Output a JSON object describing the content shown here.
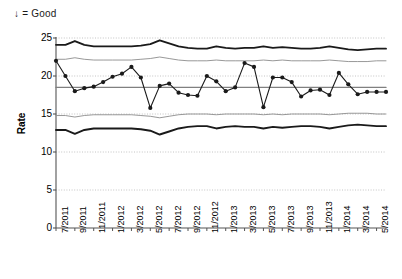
{
  "annotation": {
    "text": "↓ = Good"
  },
  "axes": {
    "y_title": "Rate",
    "y_ticks": [
      0,
      5,
      10,
      15,
      20,
      25
    ],
    "x_ticks": [
      "7/2011",
      "9/2011",
      "11/2011",
      "1/2012",
      "3/2012",
      "5/2012",
      "7/2012",
      "9/2012",
      "11/2012",
      "1/2013",
      "3/2013",
      "5/2013",
      "7/2013",
      "9/2013",
      "11/2013",
      "1/2014",
      "3/2014",
      "5/2014"
    ]
  },
  "colors": {
    "series": "#1a1a1a",
    "control_limit": "#1a1a1a",
    "sigma_line": "#8c8c8c",
    "center_line": "#808080",
    "grid": "#b5b5b5",
    "axis": "#555555"
  },
  "chart_data": {
    "type": "line",
    "title": "",
    "subtitle": "",
    "xlabel": "",
    "ylabel": "Rate",
    "ylim": [
      0,
      25
    ],
    "grid": true,
    "grid_style": "dotted-horizontal",
    "legend": "none",
    "annotations": [
      "↓ = Good"
    ],
    "x": [
      "7/2011",
      "8/2011",
      "9/2011",
      "10/2011",
      "11/2011",
      "12/2011",
      "1/2012",
      "2/2012",
      "3/2012",
      "4/2012",
      "5/2012",
      "6/2012",
      "7/2012",
      "8/2012",
      "9/2012",
      "10/2012",
      "11/2012",
      "12/2012",
      "1/2013",
      "2/2013",
      "3/2013",
      "4/2013",
      "5/2013",
      "6/2013",
      "7/2013",
      "8/2013",
      "9/2013",
      "10/2013",
      "11/2013",
      "12/2013",
      "1/2014",
      "2/2014",
      "3/2014",
      "4/2014",
      "5/2014",
      "6/2014"
    ],
    "tick_every": 2,
    "series": [
      {
        "name": "Rate",
        "type": "line-markers",
        "values": [
          22.0,
          20.0,
          18.0,
          18.4,
          18.6,
          19.2,
          19.9,
          20.3,
          21.2,
          19.8,
          15.8,
          18.7,
          19.0,
          17.8,
          17.5,
          17.4,
          20.0,
          19.3,
          18.0,
          18.5,
          21.7,
          21.2,
          15.9,
          19.8,
          19.8,
          19.2,
          17.3,
          18.1,
          18.2,
          17.5,
          20.4,
          18.9,
          17.6,
          17.9,
          17.9,
          17.9
        ]
      },
      {
        "name": "Upper Control Limit",
        "type": "line",
        "style": "thick",
        "values": [
          24.1,
          24.1,
          24.6,
          24.1,
          23.9,
          23.9,
          23.9,
          23.9,
          23.9,
          24.0,
          24.2,
          24.7,
          24.3,
          23.9,
          23.7,
          23.6,
          23.6,
          23.9,
          23.7,
          23.6,
          23.7,
          23.7,
          23.9,
          23.7,
          23.8,
          23.7,
          23.6,
          23.6,
          23.7,
          23.9,
          23.7,
          23.5,
          23.4,
          23.5,
          23.6,
          23.6
        ]
      },
      {
        "name": "Upper 2-Sigma",
        "type": "line",
        "style": "thin",
        "values": [
          22.2,
          22.2,
          22.4,
          22.2,
          22.1,
          22.1,
          22.1,
          22.1,
          22.1,
          22.2,
          22.3,
          22.5,
          22.3,
          22.1,
          22.0,
          22.0,
          22.0,
          22.1,
          22.0,
          22.0,
          22.0,
          22.0,
          22.1,
          22.0,
          22.1,
          22.0,
          22.0,
          22.0,
          22.0,
          22.1,
          22.0,
          21.9,
          21.9,
          21.9,
          22.0,
          22.0
        ]
      },
      {
        "name": "Center Line",
        "type": "line",
        "style": "center",
        "values": [
          18.5,
          18.5,
          18.5,
          18.5,
          18.5,
          18.5,
          18.5,
          18.5,
          18.5,
          18.5,
          18.5,
          18.5,
          18.5,
          18.5,
          18.5,
          18.5,
          18.5,
          18.5,
          18.5,
          18.5,
          18.5,
          18.5,
          18.5,
          18.5,
          18.5,
          18.5,
          18.5,
          18.5,
          18.5,
          18.5,
          18.5,
          18.5,
          18.5,
          18.5,
          18.5,
          18.5
        ]
      },
      {
        "name": "Lower 2-Sigma",
        "type": "line",
        "style": "thin",
        "values": [
          14.8,
          14.8,
          14.6,
          14.8,
          14.9,
          14.9,
          14.9,
          14.9,
          14.9,
          14.8,
          14.7,
          14.5,
          14.7,
          14.9,
          15.0,
          15.0,
          15.0,
          14.9,
          15.0,
          15.0,
          15.0,
          15.0,
          14.9,
          15.0,
          14.9,
          15.0,
          15.0,
          15.0,
          15.0,
          14.9,
          15.0,
          15.1,
          15.1,
          15.1,
          15.0,
          15.0
        ]
      },
      {
        "name": "Lower Control Limit",
        "type": "line",
        "style": "thick",
        "values": [
          12.9,
          12.9,
          12.4,
          12.9,
          13.1,
          13.1,
          13.1,
          13.1,
          13.1,
          13.0,
          12.8,
          12.3,
          12.7,
          13.1,
          13.3,
          13.4,
          13.4,
          13.1,
          13.3,
          13.4,
          13.3,
          13.3,
          13.1,
          13.3,
          13.2,
          13.3,
          13.4,
          13.4,
          13.3,
          13.1,
          13.3,
          13.5,
          13.6,
          13.5,
          13.4,
          13.4
        ]
      }
    ]
  }
}
